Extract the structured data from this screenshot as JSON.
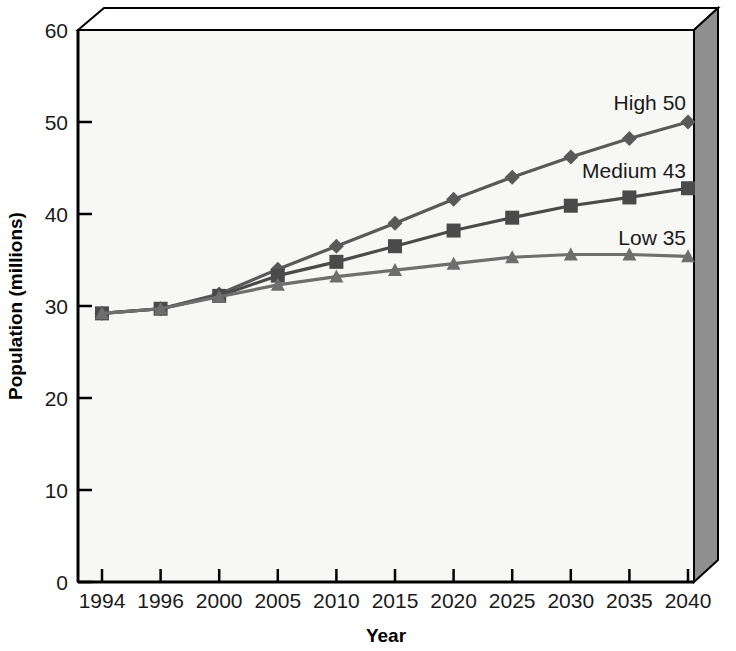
{
  "chart_data": {
    "type": "line",
    "title": "",
    "xlabel": "Year",
    "ylabel": "Population (millions)",
    "categories": [
      "1994",
      "1996",
      "2000",
      "2005",
      "2010",
      "2015",
      "2020",
      "2025",
      "2030",
      "2035",
      "2040"
    ],
    "ylim": [
      0,
      60
    ],
    "yticks": [
      "0",
      "10",
      "20",
      "30",
      "40",
      "50",
      "60"
    ],
    "grid": false,
    "legend_position": "inline-right-end-labels",
    "series": [
      {
        "name": "High",
        "end_label": "High 50",
        "marker": "diamond",
        "color": "#595959",
        "values": [
          29.2,
          29.7,
          31.3,
          34.0,
          36.5,
          39.0,
          41.6,
          44.0,
          46.2,
          48.2,
          50.0
        ]
      },
      {
        "name": "Medium",
        "end_label": "Medium 43",
        "marker": "square",
        "color": "#4a4a4a",
        "values": [
          29.2,
          29.7,
          31.1,
          33.3,
          34.8,
          36.5,
          38.2,
          39.6,
          40.9,
          41.8,
          42.8
        ]
      },
      {
        "name": "Low",
        "end_label": "Low 35",
        "marker": "triangle",
        "color": "#6e6e6e",
        "values": [
          29.2,
          29.7,
          31.0,
          32.3,
          33.2,
          33.9,
          34.6,
          35.3,
          35.6,
          35.6,
          35.4
        ]
      }
    ],
    "annotations": [
      "High 50",
      "Medium 43",
      "Low 35"
    ],
    "colors": {
      "plot_background": "#f7f7f5",
      "axis": "#000000",
      "wall_shade": "#8c8c8c",
      "wall_top": "#ffffff",
      "text": "#1a1a1a"
    }
  }
}
